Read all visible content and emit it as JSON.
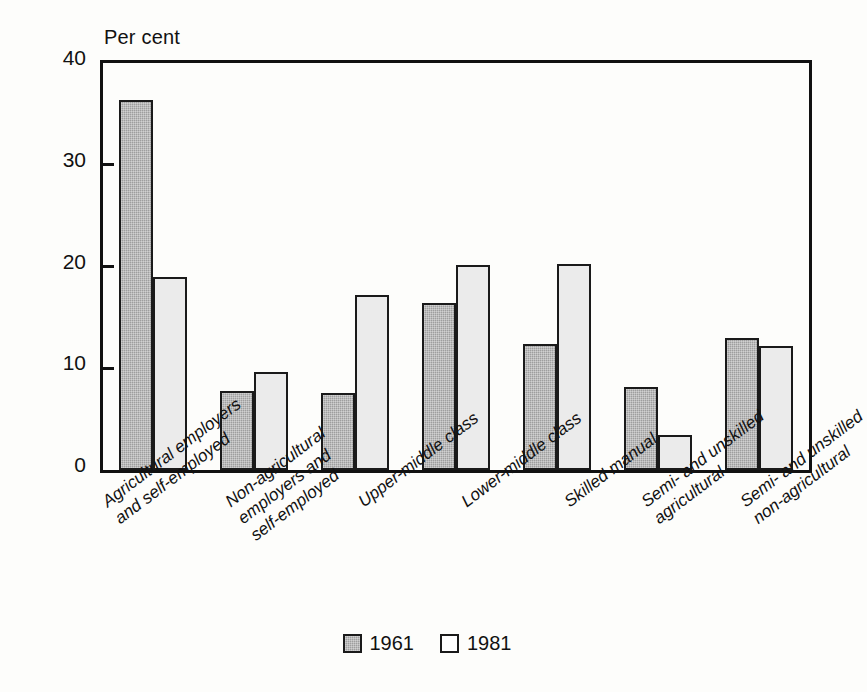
{
  "chart_data": {
    "type": "bar",
    "title": "",
    "ylabel": "Per cent",
    "xlabel": "",
    "ylim": [
      0,
      40
    ],
    "yticks": [
      0,
      10,
      20,
      30,
      40
    ],
    "ytick_labels": [
      "0",
      "10",
      "20",
      "30",
      "40"
    ],
    "grid": false,
    "legend_position": "bottom-center",
    "categories": [
      "Agricultural employers\nand self-employed",
      "Non-agricultural\nemployers and\nself-employed",
      "Upper-middle class",
      "Lower-middle class",
      "Skilled manual",
      "Semi- and unskilled\nagricultural",
      "Semi- and unskilled\nnon-agricultural"
    ],
    "category_lines": [
      [
        "Agricultural employers",
        "and self-employed"
      ],
      [
        "Non-agricultural",
        "employers and",
        "self-employed"
      ],
      [
        "Upper-middle class"
      ],
      [
        "Lower-middle class"
      ],
      [
        "Skilled manual"
      ],
      [
        "Semi- and unskilled",
        "agricultural"
      ],
      [
        "Semi- and unskilled",
        "non-agricultural"
      ]
    ],
    "series": [
      {
        "name": "1961",
        "color": "#9e9e9e",
        "values": [
          36.4,
          7.8,
          7.6,
          16.4,
          12.4,
          8.2,
          13.0
        ]
      },
      {
        "name": "1981",
        "color": "#ebebeb",
        "values": [
          19.0,
          9.6,
          17.2,
          20.1,
          20.2,
          3.4,
          12.2
        ]
      }
    ]
  },
  "legend": {
    "items": [
      {
        "label": "1961",
        "swatch": "dark-hatched-swatch"
      },
      {
        "label": "1981",
        "swatch": "light-swatch"
      }
    ]
  },
  "colors": {
    "axis": "#111111",
    "bar_1961": "#9e9e9e",
    "bar_1981": "#ebebeb",
    "bar_outline": "#1a1a1a",
    "background": "#fdfdfb"
  }
}
